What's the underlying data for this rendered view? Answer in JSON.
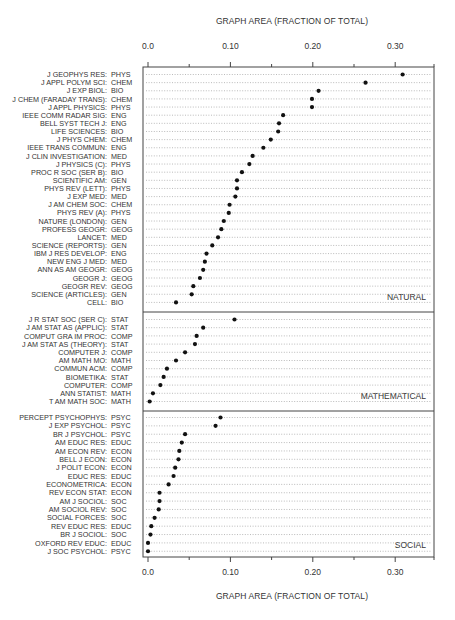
{
  "chart_data": {
    "type": "scatter",
    "subtype": "dot-plot",
    "title": "",
    "xlabel_top": "GRAPH AREA (FRACTION OF TOTAL)",
    "xlabel_bottom": "GRAPH AREA (FRACTION OF TOTAL)",
    "xlim": [
      0,
      0.35
    ],
    "major_ticks": [
      0.0,
      0.1,
      0.2,
      0.3
    ],
    "tick_labels": [
      "0.0",
      "0.10",
      "0.20",
      "0.30"
    ],
    "minor_ticks": [
      0.05,
      0.15,
      0.25,
      0.35
    ],
    "grid": false,
    "panels": [
      {
        "name": "NATURAL",
        "rows": [
          {
            "journal": "J GEOPHYS RES:",
            "field": "PHYS",
            "value": 0.309
          },
          {
            "journal": "J APPL POLYM SCI:",
            "field": "CHEM",
            "value": 0.264
          },
          {
            "journal": "J EXP BIOL:",
            "field": "BIO",
            "value": 0.207
          },
          {
            "journal": "J CHEM (FARADAY TRANS):",
            "field": "CHEM",
            "value": 0.199
          },
          {
            "journal": "J APPL PHYSICS:",
            "field": "PHYS",
            "value": 0.199
          },
          {
            "journal": "IEEE COMM RADAR SIG:",
            "field": "ENG",
            "value": 0.164
          },
          {
            "journal": "BELL SYST TECH J:",
            "field": "ENG",
            "value": 0.159
          },
          {
            "journal": "LIFE SCIENCES:",
            "field": "BIO",
            "value": 0.158
          },
          {
            "journal": "J PHYS CHEM:",
            "field": "CHEM",
            "value": 0.149
          },
          {
            "journal": "IEEE TRANS COMMUN:",
            "field": "ENG",
            "value": 0.14
          },
          {
            "journal": "J CLIN INVESTIGATION:",
            "field": "MED",
            "value": 0.127
          },
          {
            "journal": "J PHYSICS (C):",
            "field": "PHYS",
            "value": 0.123
          },
          {
            "journal": "PROC R SOC (SER B):",
            "field": "BIO",
            "value": 0.114
          },
          {
            "journal": "SCIENTIFIC AM:",
            "field": "GEN",
            "value": 0.108
          },
          {
            "journal": "PHYS REV (LETT):",
            "field": "PHYS",
            "value": 0.108
          },
          {
            "journal": "J EXP MED:",
            "field": "MED",
            "value": 0.106
          },
          {
            "journal": "J AM CHEM SOC:",
            "field": "CHEM",
            "value": 0.099
          },
          {
            "journal": "PHYS REV (A):",
            "field": "PHYS",
            "value": 0.098
          },
          {
            "journal": "NATURE (LONDON):",
            "field": "GEN",
            "value": 0.092
          },
          {
            "journal": "PROFESS GEOGR:",
            "field": "GEOG",
            "value": 0.089
          },
          {
            "journal": "LANCET:",
            "field": "MED",
            "value": 0.085
          },
          {
            "journal": "SCIENCE (REPORTS):",
            "field": "GEN",
            "value": 0.078
          },
          {
            "journal": "IBM J RES DEVELOP:",
            "field": "ENG",
            "value": 0.071
          },
          {
            "journal": "NEW ENG J MED:",
            "field": "MED",
            "value": 0.069
          },
          {
            "journal": "ANN AS AM GEOGR:",
            "field": "GEOG",
            "value": 0.067
          },
          {
            "journal": "GEOGR J:",
            "field": "GEOG",
            "value": 0.063
          },
          {
            "journal": "GEOGR REV:",
            "field": "GEOG",
            "value": 0.055
          },
          {
            "journal": "SCIENCE (ARTICLES):",
            "field": "GEN",
            "value": 0.053
          },
          {
            "journal": "CELL:",
            "field": "BIO",
            "value": 0.034
          }
        ]
      },
      {
        "name": "MATHEMATICAL",
        "rows": [
          {
            "journal": "J R STAT SOC (SER C):",
            "field": "STAT",
            "value": 0.105
          },
          {
            "journal": "J AM STAT AS (APPLIC):",
            "field": "STAT",
            "value": 0.067
          },
          {
            "journal": "COMPUT GRA IM PROC:",
            "field": "COMP",
            "value": 0.059
          },
          {
            "journal": "J AM STAT AS (THEORY):",
            "field": "STAT",
            "value": 0.057
          },
          {
            "journal": "COMPUTER J:",
            "field": "COMP",
            "value": 0.045
          },
          {
            "journal": "AM MATH MO:",
            "field": "MATH",
            "value": 0.034
          },
          {
            "journal": "COMMUN ACM:",
            "field": "COMP",
            "value": 0.023
          },
          {
            "journal": "BIOMETIKA:",
            "field": "STAT",
            "value": 0.019
          },
          {
            "journal": "COMPUTER:",
            "field": "COMP",
            "value": 0.015
          },
          {
            "journal": "ANN STATIST:",
            "field": "MATH",
            "value": 0.006
          },
          {
            "journal": "T AM MATH SOC:",
            "field": "MATH",
            "value": 0.002
          }
        ]
      },
      {
        "name": "SOCIAL",
        "rows": [
          {
            "journal": "PERCEPT PSYCHOPHYS:",
            "field": "PSYC",
            "value": 0.088
          },
          {
            "journal": "J EXP PSYCHOL:",
            "field": "PSYC",
            "value": 0.082
          },
          {
            "journal": "BR J PSYCHOL:",
            "field": "PSYC",
            "value": 0.045
          },
          {
            "journal": "AM EDUC RES:",
            "field": "EDUC",
            "value": 0.041
          },
          {
            "journal": "AM ECON REV:",
            "field": "ECON",
            "value": 0.038
          },
          {
            "journal": "BELL J ECON:",
            "field": "ECON",
            "value": 0.037
          },
          {
            "journal": "J POLIT ECON:",
            "field": "ECON",
            "value": 0.033
          },
          {
            "journal": "EDUC RES:",
            "field": "EDUC",
            "value": 0.031
          },
          {
            "journal": "ECONOMETRICA:",
            "field": "ECON",
            "value": 0.025
          },
          {
            "journal": "REV ECON STAT:",
            "field": "ECON",
            "value": 0.014
          },
          {
            "journal": "AM J SOCIOL:",
            "field": "SOC",
            "value": 0.014
          },
          {
            "journal": "AM SOCIOL REV:",
            "field": "SOC",
            "value": 0.013
          },
          {
            "journal": "SOCIAL FORCES:",
            "field": "SOC",
            "value": 0.008
          },
          {
            "journal": "REV EDUC RES:",
            "field": "EDUC",
            "value": 0.004
          },
          {
            "journal": "BR J SOCIOL:",
            "field": "SOC",
            "value": 0.003
          },
          {
            "journal": "OXFORD REV EDUC:",
            "field": "EDUC",
            "value": 0.0
          },
          {
            "journal": "J SOC PSYCHOL:",
            "field": "PSYC",
            "value": 0.0
          }
        ]
      }
    ]
  }
}
